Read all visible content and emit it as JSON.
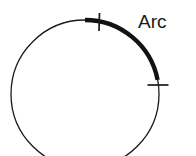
{
  "figure": {
    "title": "Arc",
    "background_color": "#ffffff",
    "stroke_color": "#1a1a1a",
    "canvas": {
      "width": 196,
      "height": 156
    },
    "circle": {
      "name": "base-circle",
      "center_x": 85,
      "center_y": 94,
      "radius": 74,
      "stroke_width": 1.3,
      "fill": "none"
    },
    "arc_segment": {
      "name": "highlighted-arc",
      "stroke_width": 4.2,
      "start_angle_deg": -90,
      "end_angle_deg": -11,
      "start_point": {
        "x": 85,
        "y": 20
      },
      "end_point": {
        "x": 157.6,
        "y": 79.9
      },
      "sweep": "clockwise"
    },
    "ticks": [
      {
        "name": "arc-start-tick",
        "orientation": "vertical",
        "x1": 99.5,
        "y1": 13.0,
        "x2": 99.0,
        "y2": 31.0,
        "stroke_width": 1.6
      },
      {
        "name": "arc-end-tick",
        "orientation": "horizontal",
        "x1": 147.5,
        "y1": 85.0,
        "x2": 168.5,
        "y2": 85.0,
        "stroke_width": 1.6
      }
    ],
    "label": {
      "name": "arc-label",
      "text": "Arc",
      "x": 138,
      "y": 28,
      "font_size": 19,
      "color": "#1a1a1a"
    }
  }
}
